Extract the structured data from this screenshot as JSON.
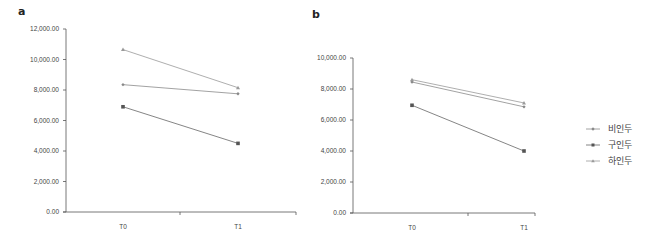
{
  "chart_data": [
    {
      "type": "line",
      "panel": "a",
      "title": "",
      "xlabel": "",
      "ylabel": "",
      "categories": [
        "T0",
        "T1"
      ],
      "ylim": [
        0,
        12000
      ],
      "yticks": [
        "0.00",
        "2,000.00",
        "4,000.00",
        "6,000.00",
        "8,000.00",
        "10,000.00",
        "12,000.00"
      ],
      "grid": false,
      "series": [
        {
          "name": "비인두",
          "marker": "diamond",
          "values": [
            8350,
            7750
          ]
        },
        {
          "name": "구인두",
          "marker": "square",
          "values": [
            6900,
            4500
          ]
        },
        {
          "name": "하인두",
          "marker": "triangle",
          "values": [
            10650,
            8150
          ]
        }
      ]
    },
    {
      "type": "line",
      "panel": "b",
      "title": "",
      "xlabel": "",
      "ylabel": "",
      "categories": [
        "T0",
        "T1"
      ],
      "ylim": [
        0,
        10000
      ],
      "yticks": [
        "0.00",
        "2,000.00",
        "4,000.00",
        "6,000.00",
        "8,000.00",
        "10,000.00"
      ],
      "grid": false,
      "series": [
        {
          "name": "비인두",
          "marker": "diamond",
          "values": [
            8450,
            6850
          ]
        },
        {
          "name": "구인두",
          "marker": "square",
          "values": [
            6950,
            4000
          ]
        },
        {
          "name": "하인두",
          "marker": "triangle",
          "values": [
            8600,
            7100
          ]
        }
      ]
    }
  ],
  "legend": {
    "position": "right",
    "items": [
      {
        "label": "비인두",
        "marker": "diamond",
        "color": "#8a8a8a"
      },
      {
        "label": "구인두",
        "marker": "square",
        "color": "#666666"
      },
      {
        "label": "하인두",
        "marker": "triangle",
        "color": "#9a9a9a"
      }
    ]
  },
  "panels": {
    "a": {
      "label": "a"
    },
    "b": {
      "label": "b"
    }
  },
  "colors": {
    "axis": "#555555",
    "line": "#8c8c8c"
  }
}
